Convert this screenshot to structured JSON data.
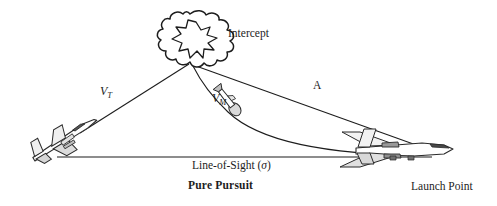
{
  "figure": {
    "title": "Pure Pursuit",
    "background_color": "#ffffff",
    "ink_color": "#1d1d1d",
    "width": 497,
    "height": 206
  },
  "labels": {
    "intercept": "Intercept",
    "launch_point": "Launch Point",
    "line_of_sight_prefix": "Line-of-Sight (",
    "line_of_sight_symbol": "σ",
    "line_of_sight_suffix": ")",
    "target_velocity": "V",
    "target_velocity_sub": "T",
    "missile_velocity": "V",
    "missile_velocity_sub": "M",
    "range_label": "A"
  },
  "icons": {
    "explosion": "explosion-burst-icon",
    "target_aircraft": "target-aircraft-icon",
    "launch_aircraft": "launch-aircraft-icon",
    "missile": "missile-icon"
  },
  "geometry": {
    "intercept_point": [
      192,
      62
    ],
    "target_point": [
      88,
      128
    ],
    "launch_point": [
      404,
      152
    ],
    "los_line_start": [
      57,
      157
    ],
    "los_line_end": [
      430,
      157
    ],
    "missile_marker": [
      230,
      103
    ]
  }
}
